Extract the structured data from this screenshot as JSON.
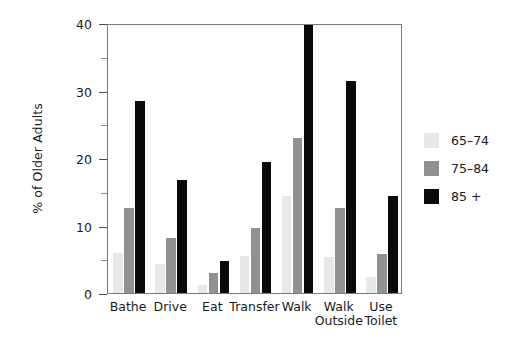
{
  "chart_data": {
    "type": "bar",
    "title": "",
    "subtitle": "",
    "xlabel": "",
    "ylabel": "% of Older Adults",
    "categories": [
      "Bathe",
      "Drive",
      "Eat",
      "Transfer",
      "Walk",
      "Walk\nOutside",
      "Use\nToilet"
    ],
    "series": [
      {
        "name": "65–74",
        "color": "#e8e8e8",
        "values": [
          5.9,
          4.3,
          1.2,
          5.5,
          14.4,
          5.4,
          2.3
        ]
      },
      {
        "name": "75–84",
        "color": "#919191",
        "values": [
          12.6,
          8.2,
          3.0,
          9.6,
          22.9,
          12.6,
          5.8
        ]
      },
      {
        "name": "85 +",
        "color": "#0a0a0a",
        "values": [
          28.4,
          16.7,
          4.8,
          19.4,
          39.7,
          31.4,
          14.3
        ]
      }
    ],
    "ylim": [
      0,
      40
    ],
    "ytick_major": [
      0,
      10,
      20,
      30,
      40
    ],
    "ytick_minor": [
      5,
      15,
      25,
      35
    ],
    "ytick_labels": [
      "0",
      "10",
      "20",
      "30",
      "40"
    ],
    "grid": false,
    "legend_position": "right",
    "frame": true
  },
  "legend": {
    "entries": [
      {
        "label": "65–74"
      },
      {
        "label": "75–84"
      },
      {
        "label": "85 +"
      }
    ]
  }
}
